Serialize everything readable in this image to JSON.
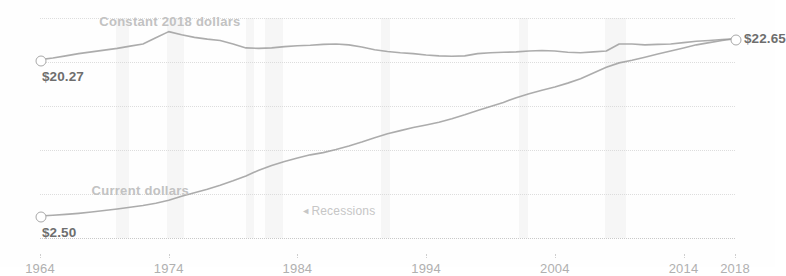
{
  "chart_data": {
    "type": "line",
    "title": "",
    "subtitle": "",
    "xlabel": "",
    "ylabel": "",
    "xlim": [
      1964,
      2018
    ],
    "ylim": [
      0,
      25
    ],
    "grid": true,
    "legend_position": "inline-annotation",
    "y_ticks": [
      "$25",
      "20",
      "15",
      "10",
      "5",
      "0"
    ],
    "y_tick_values": [
      25,
      20,
      15,
      10,
      5,
      0
    ],
    "x_ticks": [
      "1964",
      "1974",
      "1984",
      "1994",
      "2004",
      "2014",
      "2018"
    ],
    "x_tick_values": [
      1964,
      1974,
      1984,
      1994,
      2004,
      2014,
      2018
    ],
    "series": [
      {
        "name": "Constant 2018 dollars",
        "label_x": 1968.6,
        "label_y": 24.6,
        "start_label": "$20.27",
        "end_label": "$22.65",
        "x": [
          1964,
          1965,
          1966,
          1967,
          1968,
          1969,
          1970,
          1971,
          1972,
          1973,
          1974,
          1975,
          1976,
          1977,
          1978,
          1979,
          1980,
          1981,
          1982,
          1983,
          1984,
          1985,
          1986,
          1987,
          1988,
          1989,
          1990,
          1991,
          1992,
          1993,
          1994,
          1995,
          1996,
          1997,
          1998,
          1999,
          2000,
          2001,
          2002,
          2003,
          2004,
          2005,
          2006,
          2007,
          2008,
          2009,
          2010,
          2011,
          2012,
          2013,
          2014,
          2015,
          2016,
          2017,
          2018
        ],
        "y": [
          20.27,
          20.45,
          20.7,
          20.95,
          21.15,
          21.35,
          21.55,
          21.8,
          22.05,
          22.75,
          23.45,
          23.1,
          22.8,
          22.6,
          22.45,
          22.05,
          21.6,
          21.55,
          21.6,
          21.75,
          21.85,
          21.9,
          22.0,
          22.05,
          21.95,
          21.7,
          21.4,
          21.2,
          21.05,
          20.95,
          20.8,
          20.7,
          20.65,
          20.7,
          20.95,
          21.05,
          21.1,
          21.15,
          21.25,
          21.3,
          21.25,
          21.1,
          21.05,
          21.15,
          21.25,
          22.05,
          22.05,
          21.95,
          22.0,
          22.05,
          22.2,
          22.35,
          22.45,
          22.55,
          22.65
        ]
      },
      {
        "name": "Current dollars",
        "label_x": 1968.0,
        "label_y": 5.35,
        "start_label": "$2.50",
        "end_label": "$22.65",
        "x": [
          1964,
          1965,
          1966,
          1967,
          1968,
          1969,
          1970,
          1971,
          1972,
          1973,
          1974,
          1975,
          1976,
          1977,
          1978,
          1979,
          1980,
          1981,
          1982,
          1983,
          1984,
          1985,
          1986,
          1987,
          1988,
          1989,
          1990,
          1991,
          1992,
          1993,
          1994,
          1995,
          1996,
          1997,
          1998,
          1999,
          2000,
          2001,
          2002,
          2003,
          2004,
          2005,
          2006,
          2007,
          2008,
          2009,
          2010,
          2011,
          2012,
          2013,
          2014,
          2015,
          2016,
          2017,
          2018
        ],
        "y": [
          2.5,
          2.58,
          2.68,
          2.8,
          2.95,
          3.12,
          3.3,
          3.5,
          3.7,
          3.95,
          4.3,
          4.75,
          5.15,
          5.55,
          6.0,
          6.5,
          7.05,
          7.7,
          8.25,
          8.7,
          9.1,
          9.45,
          9.7,
          10.05,
          10.45,
          10.9,
          11.4,
          11.85,
          12.2,
          12.55,
          12.85,
          13.15,
          13.55,
          14.0,
          14.5,
          14.95,
          15.4,
          15.95,
          16.4,
          16.8,
          17.15,
          17.6,
          18.1,
          18.75,
          19.4,
          19.9,
          20.2,
          20.55,
          20.9,
          21.25,
          21.6,
          21.95,
          22.2,
          22.45,
          22.65
        ]
      }
    ],
    "recessions": [
      {
        "start": 1969.9,
        "end": 1970.9
      },
      {
        "start": 1973.9,
        "end": 1975.2
      },
      {
        "start": 1980.0,
        "end": 1980.6
      },
      {
        "start": 1981.5,
        "end": 1982.9
      },
      {
        "start": 1990.5,
        "end": 1991.2
      },
      {
        "start": 2001.2,
        "end": 2001.9
      },
      {
        "start": 2007.9,
        "end": 2009.5
      }
    ],
    "annotations": [
      {
        "name": "recessions-note",
        "text": "Recessions",
        "arrow": "◄",
        "x": 1984.3,
        "y": 3.0
      }
    ],
    "colors": {
      "line": "#9a9a9a",
      "recession_band": "#f3f3f3",
      "gridline": "#d8d8d8",
      "tick_text": "#b0b0b0",
      "end_label": "#6e6e6e",
      "series_label": "#c2c2c2"
    }
  }
}
